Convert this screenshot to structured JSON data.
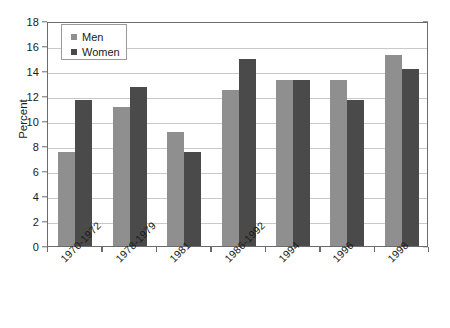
{
  "chart_data": {
    "type": "bar",
    "title": "",
    "xlabel": "",
    "ylabel": "Percent",
    "ylim": [
      0,
      18
    ],
    "ytick_step": 2,
    "yticks": [
      0,
      2,
      4,
      6,
      8,
      10,
      12,
      14,
      16,
      18
    ],
    "grid": true,
    "legend_position": "top-left",
    "categories": [
      "1970-1972",
      "1978-1979",
      "1981",
      "1986-1992",
      "1994",
      "1996",
      "1998"
    ],
    "series": [
      {
        "name": "Men",
        "color": "#8f8f8f",
        "values": [
          7.5,
          11.1,
          9.1,
          12.5,
          13.3,
          13.3,
          15.3
        ]
      },
      {
        "name": "Women",
        "color": "#4a4a4a",
        "values": [
          11.7,
          12.7,
          7.5,
          15.0,
          13.3,
          11.7,
          14.2
        ]
      }
    ]
  },
  "legend": {
    "items": [
      {
        "label": "Men"
      },
      {
        "label": "Women"
      }
    ]
  },
  "colors": {
    "men": "#8f8f8f",
    "women": "#4a4a4a",
    "axis": "#6b6b6b",
    "grid": "#c9c9c9",
    "background": "#ffffff"
  }
}
